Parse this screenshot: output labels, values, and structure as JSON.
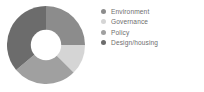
{
  "chart_data": {
    "type": "pie",
    "variant": "donut",
    "title": "",
    "xlabel": "",
    "ylabel": "",
    "grid": false,
    "legend_position": "right",
    "hole_ratio": 0.39,
    "start_angle_deg": 0,
    "direction": "clockwise",
    "categories": [
      "Environment",
      "Governance",
      "Policy",
      "Design/housing"
    ],
    "values": [
      25,
      12.5,
      26.5,
      36
    ],
    "units": "percent",
    "colors": [
      "#8c8c8c",
      "#d5d5d5",
      "#a0a0a0",
      "#6c6c6c"
    ],
    "slices": [
      {
        "label": "Environment",
        "value": 25,
        "color": "#8c8c8c",
        "start_deg": 0,
        "end_deg": 90
      },
      {
        "label": "Governance",
        "value": 12.5,
        "color": "#d5d5d5",
        "start_deg": 90,
        "end_deg": 135
      },
      {
        "label": "Policy",
        "value": 26.5,
        "color": "#a0a0a0",
        "start_deg": 135,
        "end_deg": 230
      },
      {
        "label": "Design/housing",
        "value": 36,
        "color": "#6c6c6c",
        "start_deg": 230,
        "end_deg": 360
      }
    ]
  },
  "legend": {
    "items": [
      {
        "label": "Environment",
        "color": "#8c8c8c",
        "swatch": "legend-dot-icon"
      },
      {
        "label": "Governance",
        "color": "#d5d5d5",
        "swatch": "legend-dot-icon"
      },
      {
        "label": "Policy",
        "color": "#a0a0a0",
        "swatch": "legend-dot-icon"
      },
      {
        "label": "Design/housing",
        "color": "#6c6c6c",
        "swatch": "legend-dot-icon"
      }
    ]
  },
  "theme": {
    "background": "#ffffff",
    "text_color": "#6e6e6e",
    "hole_color": "#ffffff"
  }
}
